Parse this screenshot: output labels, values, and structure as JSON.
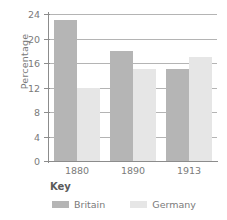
{
  "chart_data": {
    "type": "bar",
    "title": "",
    "subtitle": "",
    "xlabel": "",
    "ylabel": "Percentage",
    "categories": [
      "1880",
      "1890",
      "1913"
    ],
    "series": [
      {
        "name": "Britain",
        "color": "#b5b5b5",
        "values": [
          23,
          18,
          15
        ]
      },
      {
        "name": "Germany",
        "color": "#e6e6e6",
        "values": [
          12,
          15,
          17
        ]
      }
    ],
    "ylim": [
      0,
      24
    ],
    "ytick_values": [
      0,
      4,
      8,
      12,
      16,
      20,
      24
    ],
    "ytick_labels": [
      "0",
      "4",
      "8",
      "12",
      "16",
      "20",
      "24"
    ],
    "grid": "horizontal",
    "legend_position": "bottom-left",
    "legend_title": "Key",
    "legend_entries": [
      "Britain",
      "Germany"
    ]
  },
  "axes": {
    "y_title": "Percentage",
    "y_ticks": [
      "24",
      "20",
      "16",
      "12",
      "8",
      "4",
      "0"
    ],
    "x_ticks": [
      "1880",
      "1890",
      "1913"
    ]
  },
  "key": {
    "title": "Key",
    "items": [
      {
        "label": "Britain",
        "swatch": "britain-swatch"
      },
      {
        "label": "Germany",
        "swatch": "germany-swatch"
      }
    ]
  }
}
